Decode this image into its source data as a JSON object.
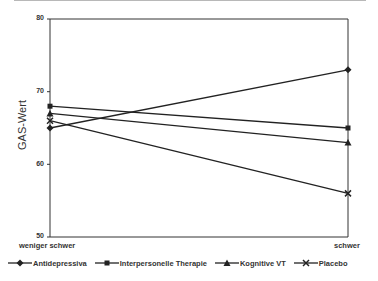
{
  "chart_data": {
    "type": "line",
    "title": "",
    "xlabel": "",
    "ylabel": "GAS-Wert",
    "categories": [
      "weniger schwer",
      "schwer"
    ],
    "ylim": [
      50,
      80
    ],
    "yticks": [
      50,
      60,
      70,
      80
    ],
    "grid": false,
    "legend_position": "bottom",
    "series": [
      {
        "name": "Antidepressiva",
        "marker": "diamond",
        "values": [
          65,
          73
        ]
      },
      {
        "name": "Interpersonelle Therapie",
        "marker": "square",
        "values": [
          68,
          65
        ]
      },
      {
        "name": "Kognitive VT",
        "marker": "triangle",
        "values": [
          67,
          63
        ]
      },
      {
        "name": "Placebo",
        "marker": "x",
        "values": [
          66,
          56
        ]
      }
    ]
  },
  "axis": {
    "ylabel": "GAS-Wert",
    "yticks": [
      "80",
      "70",
      "60",
      "50"
    ],
    "xticks": [
      "weniger schwer",
      "schwer"
    ]
  },
  "legend": [
    {
      "label": "Antidepressiva"
    },
    {
      "label": "Interpersonelle Therapie"
    },
    {
      "label": "Kognitive VT"
    },
    {
      "label": "Placebo"
    }
  ]
}
